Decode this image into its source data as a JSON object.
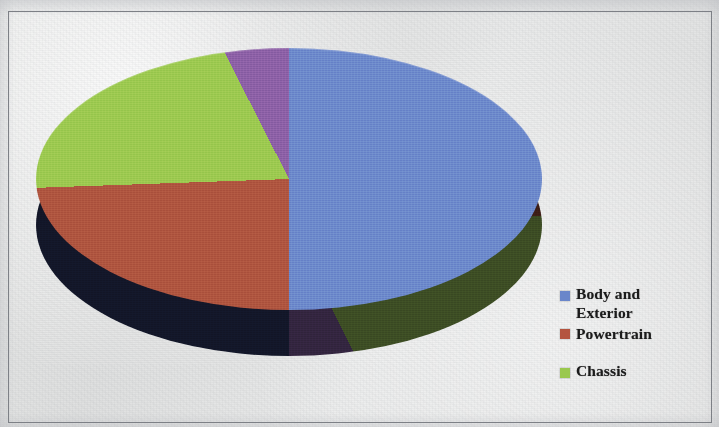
{
  "figure": {
    "background_color": "#e3e4e4",
    "frame_color": "#7d8086"
  },
  "legend": {
    "position": "right",
    "items": [
      {
        "label": "Body and\nExterior",
        "color": "#6a86ca",
        "swatch_name": "legend-swatch-blue"
      },
      {
        "label": "Powertrain",
        "color": "#b4543f",
        "swatch_name": "legend-swatch-red"
      },
      {
        "label": "Chassis",
        "color": "#9ac84e",
        "swatch_name": "legend-swatch-green"
      }
    ]
  },
  "chart_data": {
    "type": "pie",
    "title": "",
    "subtitle": "",
    "xlabel": "",
    "ylabel": "",
    "three_d": true,
    "start_angle_deg": 0,
    "direction": "clockwise",
    "grid": false,
    "legend_position": "right",
    "labels": [
      "Body and Exterior",
      "Powertrain",
      "Chassis",
      "Other"
    ],
    "values": [
      50,
      24,
      18,
      8
    ],
    "units": "percent",
    "colors": [
      "#6a86ca",
      "#ad533e",
      "#9ac84e",
      "#8a5ea4"
    ],
    "side_colors": [
      "#1b2446",
      "#6c2f22",
      "#5d7a2e",
      "#54386a"
    ],
    "slice_angles_deg": [
      {
        "label": "Body and Exterior",
        "start": 0,
        "end": 180
      },
      {
        "label": "Powertrain",
        "start": 180,
        "end": 268
      },
      {
        "label": "Chassis",
        "start": 268,
        "end": 333
      },
      {
        "label": "Other",
        "start": 333,
        "end": 360
      }
    ],
    "annotations": []
  }
}
